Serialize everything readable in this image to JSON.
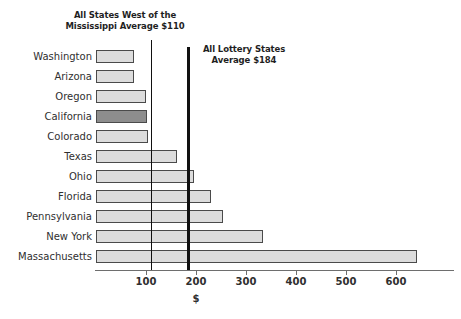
{
  "chart_data": {
    "type": "bar",
    "orientation": "horizontal",
    "title": "",
    "xlabel": "$",
    "ylabel": "",
    "xlim": [
      0,
      660
    ],
    "grid": false,
    "categories": [
      "Washington",
      "Arizona",
      "Oregon",
      "California",
      "Colorado",
      "Texas",
      "Ohio",
      "Florida",
      "Pennsylvania",
      "New York",
      "Massachusetts"
    ],
    "values": [
      75,
      75,
      99,
      101,
      104,
      162,
      196,
      230,
      254,
      334,
      642
    ],
    "highlight_category": "California",
    "xticks": [
      100,
      200,
      300,
      400,
      500,
      600
    ],
    "xticklabels": [
      "100",
      "200",
      "300",
      "400",
      "500",
      "600"
    ],
    "reference_lines": [
      {
        "name": "west-of-mississippi-average",
        "value": 110,
        "label": "All States West of the\nMississippi Average $110"
      },
      {
        "name": "all-lottery-states-average",
        "value": 184,
        "label": "All Lottery States\nAverage $184"
      }
    ],
    "colors": {
      "bar_fill": "#dcdcdc",
      "bar_highlight_fill": "#8d8d8d",
      "bar_edge": "#4a4a4a",
      "reference_line": "#111111",
      "axis": "#6e6e6e",
      "text": "#2f2f2f"
    }
  }
}
